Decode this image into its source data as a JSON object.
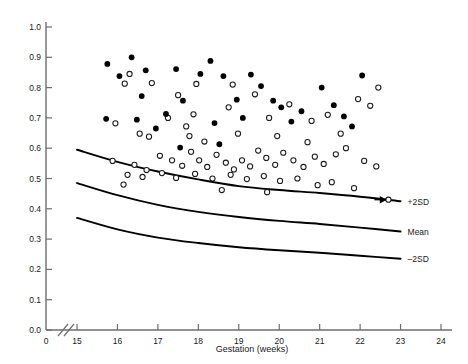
{
  "chart_data": {
    "type": "scatter",
    "title": "",
    "xlabel": "Gestation (weeks)",
    "ylabel": "",
    "xlim": [
      15,
      24
    ],
    "ylim": [
      0.0,
      1.0
    ],
    "grid": false,
    "axis_break": true,
    "x_origin_label": "0",
    "xticks": [
      15,
      16,
      17,
      18,
      19,
      20,
      21,
      22,
      23,
      24
    ],
    "xtick_labels": [
      "15",
      "16",
      "17",
      "18",
      "19",
      "20",
      "21",
      "22",
      "23",
      "24"
    ],
    "yticks": [
      0.0,
      0.1,
      0.2,
      0.3,
      0.4,
      0.5,
      0.6,
      0.7,
      0.8,
      0.9,
      1.0
    ],
    "ytick_labels": [
      "0.0",
      "0.1",
      "0.2",
      "0.3",
      "0.4",
      "0.5",
      "0.6",
      "0.7",
      "0.8",
      "0.9",
      "1.0"
    ],
    "legend_position": "none",
    "series": [
      {
        "name": "filled-circles",
        "marker": "filled circle",
        "color": "#000000",
        "points": [
          [
            15.75,
            0.878
          ],
          [
            16.05,
            0.838
          ],
          [
            16.35,
            0.9
          ],
          [
            16.7,
            0.857
          ],
          [
            16.6,
            0.772
          ],
          [
            17.45,
            0.861
          ],
          [
            17.62,
            0.757
          ],
          [
            18.05,
            0.845
          ],
          [
            15.72,
            0.697
          ],
          [
            16.48,
            0.694
          ],
          [
            16.95,
            0.665
          ],
          [
            17.55,
            0.602
          ],
          [
            18.3,
            0.888
          ],
          [
            18.62,
            0.838
          ],
          [
            18.95,
            0.76
          ],
          [
            18.4,
            0.683
          ],
          [
            18.52,
            0.613
          ],
          [
            19.3,
            0.843
          ],
          [
            19.55,
            0.805
          ],
          [
            19.85,
            0.757
          ],
          [
            20.05,
            0.735
          ],
          [
            20.55,
            0.722
          ],
          [
            21.05,
            0.8
          ],
          [
            21.35,
            0.742
          ],
          [
            21.6,
            0.705
          ],
          [
            22.05,
            0.84
          ],
          [
            20.3,
            0.688
          ],
          [
            21.8,
            0.672
          ],
          [
            17.2,
            0.713
          ],
          [
            19.1,
            0.7
          ]
        ]
      },
      {
        "name": "open-circles",
        "marker": "open circle",
        "color": "#ffffff",
        "points": [
          [
            16.3,
            0.845
          ],
          [
            16.18,
            0.813
          ],
          [
            16.85,
            0.815
          ],
          [
            17.5,
            0.775
          ],
          [
            17.95,
            0.812
          ],
          [
            18.85,
            0.81
          ],
          [
            15.95,
            0.682
          ],
          [
            16.55,
            0.648
          ],
          [
            16.78,
            0.638
          ],
          [
            17.25,
            0.7
          ],
          [
            17.7,
            0.672
          ],
          [
            17.88,
            0.712
          ],
          [
            18.15,
            0.622
          ],
          [
            18.75,
            0.735
          ],
          [
            19.4,
            0.778
          ],
          [
            19.75,
            0.7
          ],
          [
            20.25,
            0.745
          ],
          [
            20.8,
            0.69
          ],
          [
            21.2,
            0.71
          ],
          [
            21.95,
            0.762
          ],
          [
            22.25,
            0.74
          ],
          [
            22.45,
            0.8
          ],
          [
            15.88,
            0.558
          ],
          [
            16.42,
            0.545
          ],
          [
            16.72,
            0.528
          ],
          [
            17.05,
            0.575
          ],
          [
            17.35,
            0.56
          ],
          [
            17.6,
            0.542
          ],
          [
            17.82,
            0.588
          ],
          [
            18.02,
            0.56
          ],
          [
            18.22,
            0.538
          ],
          [
            18.45,
            0.578
          ],
          [
            18.68,
            0.552
          ],
          [
            18.88,
            0.53
          ],
          [
            19.08,
            0.56
          ],
          [
            19.28,
            0.54
          ],
          [
            19.48,
            0.592
          ],
          [
            19.68,
            0.568
          ],
          [
            19.9,
            0.545
          ],
          [
            20.1,
            0.585
          ],
          [
            20.35,
            0.56
          ],
          [
            20.6,
            0.538
          ],
          [
            20.88,
            0.572
          ],
          [
            21.1,
            0.548
          ],
          [
            21.4,
            0.58
          ],
          [
            21.65,
            0.6
          ],
          [
            22.1,
            0.558
          ],
          [
            22.4,
            0.54
          ],
          [
            16.25,
            0.512
          ],
          [
            16.62,
            0.505
          ],
          [
            17.1,
            0.518
          ],
          [
            17.45,
            0.502
          ],
          [
            17.92,
            0.515
          ],
          [
            18.35,
            0.5
          ],
          [
            18.8,
            0.512
          ],
          [
            19.2,
            0.498
          ],
          [
            19.62,
            0.508
          ],
          [
            20.02,
            0.492
          ],
          [
            20.45,
            0.5
          ],
          [
            20.95,
            0.478
          ],
          [
            21.3,
            0.488
          ],
          [
            21.85,
            0.468
          ],
          [
            16.15,
            0.48
          ],
          [
            18.58,
            0.462
          ],
          [
            19.7,
            0.455
          ],
          [
            22.7,
            0.43
          ],
          [
            20.7,
            0.62
          ],
          [
            21.52,
            0.648
          ],
          [
            19.95,
            0.64
          ],
          [
            18.98,
            0.648
          ],
          [
            17.78,
            0.64
          ]
        ]
      }
    ],
    "reference_curves": [
      {
        "label": "+2SD",
        "points": [
          [
            15.0,
            0.595
          ],
          [
            16.0,
            0.555
          ],
          [
            17.0,
            0.523
          ],
          [
            18.0,
            0.497
          ],
          [
            19.0,
            0.475
          ],
          [
            20.0,
            0.462
          ],
          [
            21.0,
            0.452
          ],
          [
            22.0,
            0.44
          ],
          [
            23.0,
            0.425
          ]
        ]
      },
      {
        "label": "Mean",
        "points": [
          [
            15.0,
            0.485
          ],
          [
            16.0,
            0.445
          ],
          [
            17.0,
            0.413
          ],
          [
            18.0,
            0.39
          ],
          [
            19.0,
            0.373
          ],
          [
            20.0,
            0.36
          ],
          [
            21.0,
            0.35
          ],
          [
            22.0,
            0.338
          ],
          [
            23.0,
            0.325
          ]
        ]
      },
      {
        "label": "-2SD",
        "points": [
          [
            15.0,
            0.37
          ],
          [
            16.0,
            0.332
          ],
          [
            17.0,
            0.305
          ],
          [
            18.0,
            0.287
          ],
          [
            19.0,
            0.273
          ],
          [
            20.0,
            0.263
          ],
          [
            21.0,
            0.255
          ],
          [
            22.0,
            0.245
          ],
          [
            23.0,
            0.235
          ]
        ]
      }
    ],
    "annotations": [
      {
        "name": "arrow-to-point",
        "type": "arrow",
        "target": [
          22.7,
          0.43
        ],
        "direction": "left"
      }
    ]
  },
  "labels": {
    "curve_plus2sd": "+2SD",
    "curve_mean": "Mean",
    "curve_minus2sd": "–2SD",
    "x_axis_title": "Gestation (weeks)",
    "x_origin": "0"
  },
  "colors": {
    "axis": "#6e6e6e",
    "curve": "#000000",
    "filled_marker": "#000000",
    "open_marker_stroke": "#1a1a1a",
    "background": "#ffffff",
    "text": "#1a1a1a"
  }
}
